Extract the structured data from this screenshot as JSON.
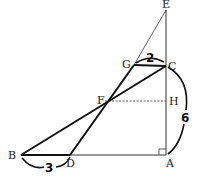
{
  "diagram": {
    "type": "geometry",
    "points": {
      "A": {
        "label": "A",
        "x": 166,
        "y": 155
      },
      "B": {
        "label": "B",
        "x": 21,
        "y": 155
      },
      "C": {
        "label": "C",
        "x": 166,
        "y": 66
      },
      "D": {
        "label": "D",
        "x": 70,
        "y": 155
      },
      "E": {
        "label": "E",
        "x": 166,
        "y": 10
      },
      "F": {
        "label": "F",
        "x": 105,
        "y": 101
      },
      "G": {
        "label": "G",
        "x": 134,
        "y": 65
      },
      "H": {
        "label": "H",
        "x": 166,
        "y": 101
      }
    },
    "measurements": {
      "GC": "2",
      "BD": "3",
      "CA": "6"
    },
    "right_angle_at": "A"
  }
}
